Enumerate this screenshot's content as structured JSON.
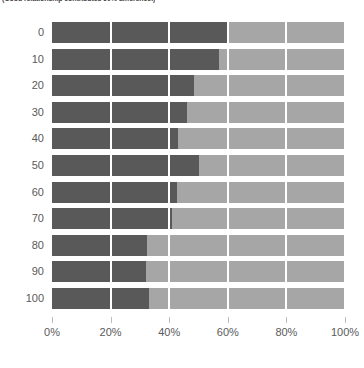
{
  "chart_data": {
    "type": "bar",
    "orientation": "horizontal",
    "stacked": true,
    "normalized": true,
    "title": "(Good relationship contributes 60% difference.)",
    "xlabel": "",
    "ylabel": "",
    "xlim": [
      0,
      100
    ],
    "xtick_labels": [
      "0%",
      "20%",
      "40%",
      "60%",
      "80%",
      "100%"
    ],
    "xtick_values": [
      0,
      20,
      40,
      60,
      80,
      100
    ],
    "grid": true,
    "legend": "none",
    "categories": [
      "0",
      "10",
      "20",
      "30",
      "40",
      "50",
      "60",
      "70",
      "80",
      "90",
      "100"
    ],
    "series": [
      {
        "name": "dark-segment",
        "color": "#595959",
        "values": [
          60,
          57,
          48.5,
          46,
          43,
          50,
          42.5,
          41,
          32.5,
          32,
          33
        ]
      },
      {
        "name": "light-segment",
        "color": "#a6a6a6",
        "values": [
          40,
          43,
          51.5,
          54,
          57,
          50,
          57.5,
          59,
          67.5,
          68,
          67
        ]
      }
    ]
  },
  "axis": {
    "tick_color": "#bdbdbd",
    "label_color": "#5a5a5a"
  }
}
